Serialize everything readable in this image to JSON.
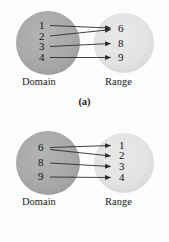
{
  "figure": {
    "background_color": "#fdfdfd",
    "domain_circle_color": "#a8a8a8",
    "range_circle_color": "#e2e2e2",
    "arrow_color": "#2b2b2b",
    "text_color": "#111111"
  },
  "panels": [
    {
      "id": "a",
      "caption": "(a)",
      "domain": {
        "label": "Domain",
        "elements": [
          "1",
          "2",
          "3",
          "4"
        ]
      },
      "range": {
        "label": "Range",
        "elements": [
          "6",
          "8",
          "9"
        ]
      },
      "mappings": [
        {
          "from": "1",
          "to": "6"
        },
        {
          "from": "2",
          "to": "6"
        },
        {
          "from": "3",
          "to": "8"
        },
        {
          "from": "4",
          "to": "9"
        }
      ]
    },
    {
      "id": "b",
      "caption": "(b)",
      "domain": {
        "label": "Domain",
        "elements": [
          "6",
          "8",
          "9"
        ]
      },
      "range": {
        "label": "Range",
        "elements": [
          "1",
          "2",
          "3",
          "4"
        ]
      },
      "mappings": [
        {
          "from": "6",
          "to": "1"
        },
        {
          "from": "6",
          "to": "2"
        },
        {
          "from": "8",
          "to": "3"
        },
        {
          "from": "9",
          "to": "4"
        }
      ]
    }
  ]
}
